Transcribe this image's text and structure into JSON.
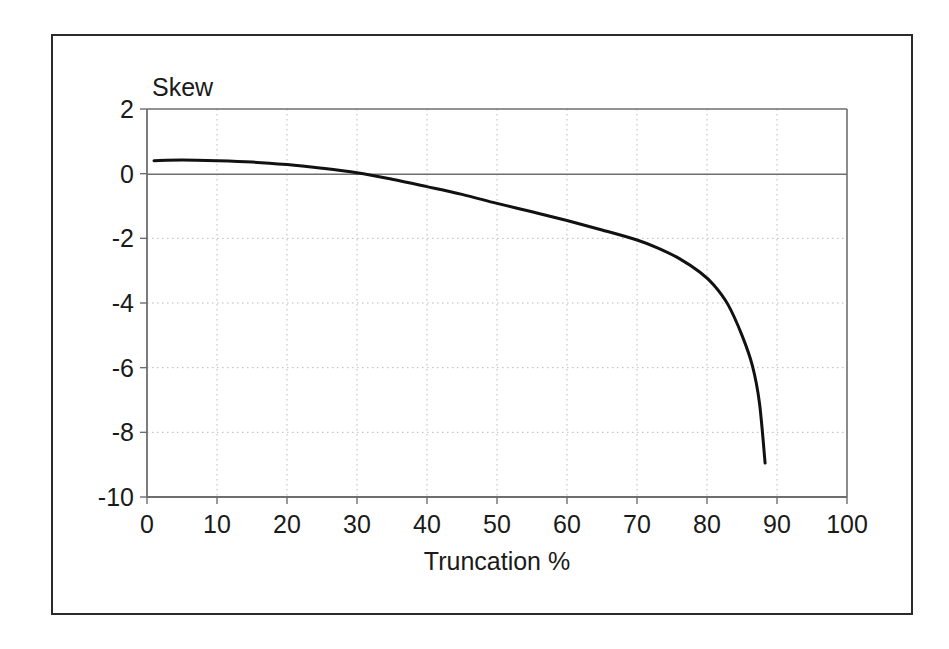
{
  "figure": {
    "frame_color": "#2b2b2b",
    "background": "#ffffff"
  },
  "chart_data": {
    "type": "line",
    "title": "",
    "subtitle": "",
    "xlabel": "Truncation %",
    "ylabel": "Skew",
    "ylabel_placement": "above-axis-top-left",
    "xlim": [
      0,
      100
    ],
    "ylim": [
      -10,
      2
    ],
    "xticks": [
      0,
      10,
      20,
      30,
      40,
      50,
      60,
      70,
      80,
      90,
      100
    ],
    "xtick_labels": [
      "0",
      "10",
      "20",
      "30",
      "40",
      "50",
      "60",
      "70",
      "80",
      "90",
      "100"
    ],
    "yticks": [
      2,
      0,
      -2,
      -4,
      -6,
      -8,
      -10
    ],
    "ytick_labels": [
      "2",
      "0",
      "-2",
      "-4",
      "-6",
      "-8",
      "-10"
    ],
    "grid": true,
    "grid_style": "dotted",
    "grid_color": "#b9b9b9",
    "axis_line_color": "#6e6e6e",
    "zero_line": true,
    "zero_line_color": "#6e6e6e",
    "legend": false,
    "legend_position": "none",
    "series": [
      {
        "name": "Skew vs Truncation",
        "color": "#111111",
        "line_width": 3,
        "x": [
          1,
          5,
          10,
          15,
          20,
          25,
          30,
          35,
          40,
          45,
          50,
          55,
          60,
          65,
          70,
          73,
          76,
          79,
          81,
          83,
          85,
          86.5,
          87.5,
          88.3
        ],
        "y": [
          0.4,
          0.42,
          0.4,
          0.36,
          0.28,
          0.17,
          0.03,
          -0.17,
          -0.4,
          -0.64,
          -0.92,
          -1.18,
          -1.45,
          -1.74,
          -2.05,
          -2.3,
          -2.62,
          -3.05,
          -3.45,
          -4.05,
          -5.0,
          -5.95,
          -7.1,
          -8.95
        ]
      }
    ]
  },
  "axis_labels": {
    "y_caption": "Skew",
    "x_caption": "Truncation %"
  }
}
